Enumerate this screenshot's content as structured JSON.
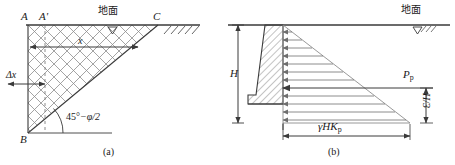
{
  "figure": {
    "panel_a": {
      "caption": "(a)",
      "ground_label": "地面",
      "vertices": {
        "A": "A",
        "A_prime": "A'",
        "B": "B",
        "C": "C"
      },
      "dimensions": {
        "x": "x",
        "delta_x": "Δx"
      },
      "angle_label_deg": "45°",
      "angle_label_rest": "−φ/2",
      "geometry": {
        "A": [
          28,
          25
        ],
        "B": [
          28,
          133
        ],
        "C": [
          158,
          25
        ],
        "A_prime": [
          45,
          25
        ],
        "ground_line_end_x": 200,
        "mesh_spacing_px": 13,
        "mesh_angle_deg": 45
      }
    },
    "panel_b": {
      "caption": "(b)",
      "ground_label": "地面",
      "height_label": "H",
      "resultant_label": "P",
      "resultant_sub": "p",
      "lever_arm_label": "H/3",
      "pressure_label_gamma": "γ",
      "pressure_label_HK": "HK",
      "pressure_label_sub": "p",
      "geometry": {
        "ground_y": 25,
        "wall_top_x": 265,
        "wall_base_x": 248,
        "wall_face_x": 283,
        "wall_bottom_y": 123,
        "pressure_tip_x": 410,
        "arrow_count": 13,
        "resultant_y": 90
      }
    }
  },
  "colors": {
    "line": "#3a3a3a",
    "thin": "#6e6e6e",
    "hatch": "#555555",
    "text": "#1a1a1a"
  }
}
